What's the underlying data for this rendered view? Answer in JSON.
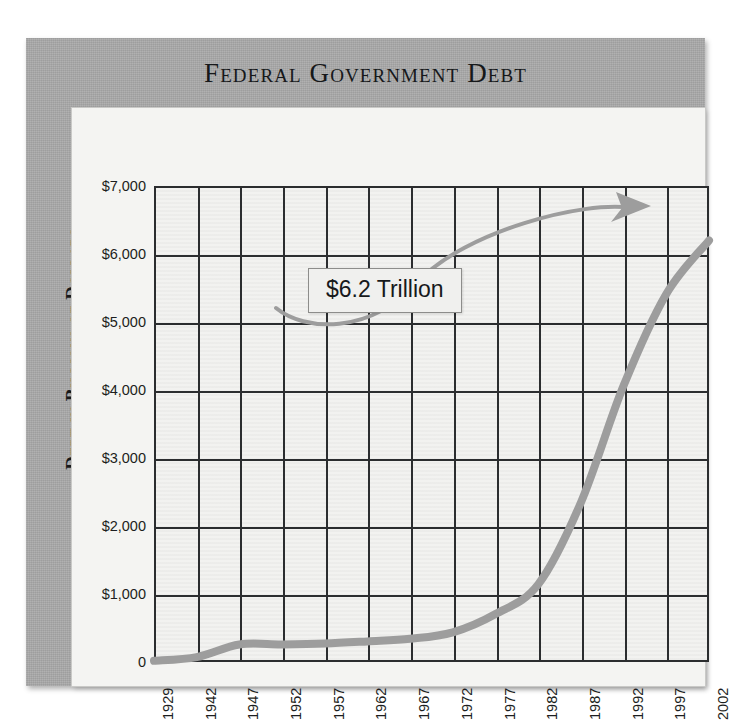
{
  "chart_data": {
    "type": "line",
    "title": "Federal Government Debt",
    "xlabel": "",
    "ylabel": "Debt in Billions of Dollars",
    "categories": [
      "1929",
      "1942",
      "1947",
      "1952",
      "1957",
      "1962",
      "1967",
      "1972",
      "1977",
      "1982",
      "1987",
      "1992",
      "1997",
      "2002"
    ],
    "values": [
      17,
      72,
      258,
      259,
      271,
      303,
      341,
      437,
      706,
      1142,
      2346,
      4065,
      5413,
      6200
    ],
    "ylim": [
      0,
      7000
    ],
    "yticks": [
      "0",
      "$1,000",
      "$2,000",
      "$3,000",
      "$4,000",
      "$5,000",
      "$6,000",
      "$7,000"
    ],
    "ytick_values": [
      0,
      1000,
      2000,
      3000,
      4000,
      5000,
      6000,
      7000
    ],
    "grid": true,
    "legend": "none",
    "series_color": "#9d9d9d",
    "annotations": [
      {
        "text": "$6.2 Trillion",
        "target_category": "2002",
        "target_value": 6200
      }
    ]
  },
  "panel": {
    "background_color": "#a8a8a8",
    "plot_background_color": "#f2f2f0",
    "grid_color": "#2b2d2f",
    "title_color": "#16181a"
  },
  "icons": {
    "arrow": "curved-arrow-icon"
  }
}
